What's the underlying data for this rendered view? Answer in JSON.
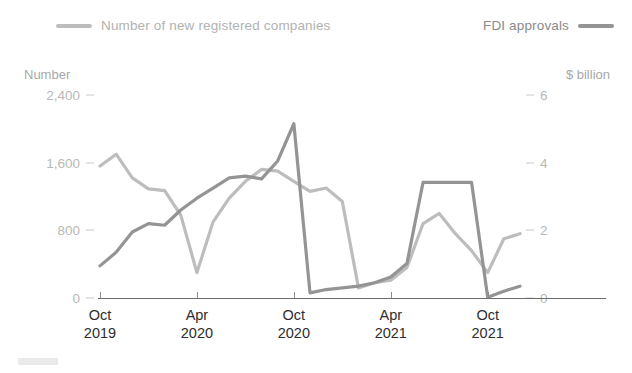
{
  "legend": {
    "companies": {
      "label": "Number of new registered companies",
      "color": "#bdbdbd"
    },
    "fdi": {
      "label": "FDI approvals",
      "color": "#949494"
    }
  },
  "axes": {
    "left_title": "Number",
    "right_title": "$ billion",
    "left_ticks": [
      "0",
      "800",
      "1,600",
      "2,400"
    ],
    "right_ticks": [
      "0",
      "2",
      "4",
      "6"
    ],
    "x_labels": [
      {
        "month": "Oct",
        "year": "2019"
      },
      {
        "month": "Apr",
        "year": "2020"
      },
      {
        "month": "Oct",
        "year": "2020"
      },
      {
        "month": "Apr",
        "year": "2021"
      },
      {
        "month": "Oct",
        "year": "2021"
      }
    ]
  },
  "chart_data": {
    "type": "line",
    "title": "",
    "xlabel": "",
    "grid": false,
    "legend_position": "top",
    "x": [
      "Oct 2019",
      "Nov 2019",
      "Dec 2019",
      "Jan 2020",
      "Feb 2020",
      "Mar 2020",
      "Apr 2020",
      "May 2020",
      "Jun 2020",
      "Jul 2020",
      "Aug 2020",
      "Sep 2020",
      "Oct 2020",
      "Nov 2020",
      "Dec 2020",
      "Jan 2021",
      "Feb 2021",
      "Mar 2021",
      "Apr 2021",
      "May 2021",
      "Jun 2021",
      "Jul 2021",
      "Aug 2021",
      "Sep 2021",
      "Oct 2021",
      "Nov 2021",
      "Dec 2021"
    ],
    "series": [
      {
        "name": "Number of new registered companies",
        "axis": "left",
        "ylabel": "Number",
        "ylim": [
          0,
          2400
        ],
        "color": "#bdbdbd",
        "values": [
          1560,
          1700,
          1420,
          1290,
          1270,
          980,
          300,
          900,
          1180,
          1380,
          1520,
          1500,
          1380,
          1260,
          1300,
          1140,
          120,
          180,
          210,
          360,
          880,
          1000,
          760,
          560,
          300,
          700,
          760
        ]
      },
      {
        "name": "FDI approvals",
        "axis": "right",
        "ylabel": "$ billion",
        "ylim": [
          0,
          6
        ],
        "color": "#949494",
        "values": [
          0.95,
          1.35,
          1.95,
          2.2,
          2.15,
          2.6,
          2.95,
          3.25,
          3.55,
          3.6,
          3.52,
          4.05,
          5.15,
          0.15,
          0.25,
          0.3,
          0.35,
          0.45,
          0.62,
          1.02,
          3.42,
          3.42,
          3.42,
          3.42,
          0.02,
          0.2,
          0.35
        ]
      }
    ]
  }
}
